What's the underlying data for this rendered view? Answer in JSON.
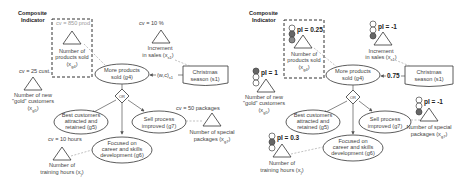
{
  "left_panel": {
    "composite_label": [
      "Composite",
      "Indicator"
    ],
    "indicators": {
      "products_sold": {
        "cv": "cv = 850 prod",
        "label": [
          "Number of",
          "products sold",
          "(x",
          "g4",
          ")"
        ]
      },
      "increment_sales": {
        "cv": "cv = 10 %",
        "label": [
          "Increment",
          "in sales (x",
          "s1",
          ")"
        ]
      },
      "gold_customers": {
        "cv": "cv = 25 cust.",
        "label": [
          "Number of new",
          "\"gold\" customers",
          "(x",
          "g5",
          ")"
        ]
      },
      "special_packages": {
        "cv": "cv = 50 packages",
        "label": [
          "Number of special",
          "packages (x",
          "g7",
          ")"
        ]
      },
      "training_hours": {
        "cv": "cv = 10 hours",
        "label": [
          "Number of",
          "training hours (x",
          "g6",
          ")"
        ]
      }
    },
    "goals": {
      "g4": [
        "More products",
        "sold (g4)"
      ],
      "g5": [
        "Best customers",
        "attracted and",
        "retained (g5)"
      ],
      "g6": [
        "Focused on",
        "career and skills",
        "development (g6)"
      ],
      "g7": [
        "Sell process",
        "improved (g7)"
      ]
    },
    "situation": [
      "Christmas",
      "season (s1)"
    ],
    "influence_label": "(w,c)",
    "influence_sub": "s1",
    "decomposition": "OR"
  },
  "right_panel": {
    "composite_label": [
      "Composite",
      "Indicator"
    ],
    "indicators": {
      "products_sold": {
        "pi": "pI = 0.25",
        "label": [
          "Number of",
          "products sold",
          "(x",
          "g4",
          ")"
        ]
      },
      "increment_sales": {
        "pi": "pI = -1",
        "label": [
          "Increment",
          "in sales (x",
          "s1",
          ")"
        ]
      },
      "gold_customers": {
        "pi": "pI = 1",
        "label": [
          "Number of new",
          "\"gold\" customers",
          "(x",
          "g5",
          ")"
        ]
      },
      "special_packages": {
        "pi": "pI = -1",
        "label": [
          "Number of special",
          "packages (x",
          "g7",
          ")"
        ]
      },
      "training_hours": {
        "pi": "pI = 0.3",
        "label": [
          "Number of",
          "training hours (x",
          "g6",
          ")"
        ]
      }
    },
    "goals": {
      "g4": [
        "More products",
        "sold (g4)"
      ],
      "g5": [
        "Best customers",
        "attracted and",
        "retained (g5)"
      ],
      "g6": [
        "Focused on",
        "career and skills",
        "development (g6)"
      ],
      "g7": [
        "Sell process",
        "improved (g7)"
      ]
    },
    "situation": [
      "Christmas",
      "season (s1)"
    ],
    "influence_value": "0.75",
    "decomposition": "OR"
  },
  "colors": {
    "line": "#555555",
    "dashed": "#999999",
    "light_on": "#666666",
    "light_off": "#ffffff"
  }
}
